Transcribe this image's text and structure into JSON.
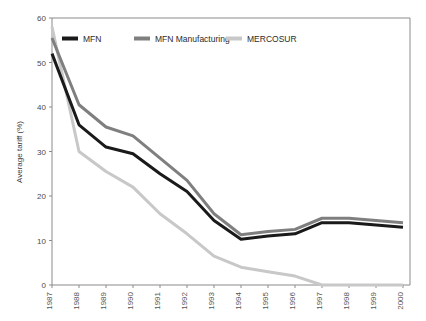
{
  "chart_data": {
    "type": "line",
    "title": "",
    "xlabel": "",
    "ylabel": "Average tariff (%)",
    "xlim": [
      1987,
      2000
    ],
    "ylim": [
      0,
      60
    ],
    "yticks": [
      0,
      10,
      20,
      30,
      40,
      50,
      60
    ],
    "grid": false,
    "legend_position": "top-left-inside",
    "x": [
      1987,
      1988,
      1989,
      1990,
      1991,
      1992,
      1993,
      1994,
      1995,
      1996,
      1997,
      1998,
      1999,
      2000
    ],
    "categories": [
      "1987",
      "1988",
      "1989",
      "1990",
      "1991",
      "1992",
      "1993",
      "1994",
      "1995",
      "1996",
      "1997",
      "1998",
      "1999",
      "2000"
    ],
    "series": [
      {
        "name": "MFN",
        "color": "#1a1a1a",
        "values": [
          52,
          36,
          31,
          29.5,
          25,
          21,
          14.5,
          10.3,
          11,
          11.5,
          14,
          14,
          13.5,
          13
        ]
      },
      {
        "name": "MFN Manufacturing",
        "color": "#7f7f7f",
        "values": [
          55.5,
          40.5,
          35.5,
          33.5,
          28.5,
          23.5,
          16,
          11.3,
          12,
          12.5,
          15,
          15,
          14.5,
          14
        ]
      },
      {
        "name": "MERCOSUR",
        "color": "#c8c8c8",
        "values": [
          58,
          30,
          25.5,
          22,
          16,
          11.5,
          6.5,
          4,
          3,
          2,
          0,
          0,
          0,
          0
        ]
      }
    ]
  },
  "axis": {
    "y_tick_labels": [
      "60",
      "50",
      "40",
      "30",
      "20",
      "10",
      "0"
    ],
    "y_axis_title": "Average tariff (%)",
    "x_tick_labels": [
      "1987",
      "1988",
      "1989",
      "1990",
      "1991",
      "1992",
      "1993",
      "1994",
      "1995",
      "1996",
      "1997",
      "1998",
      "1999",
      "2000"
    ]
  },
  "legend": {
    "items": [
      {
        "label": "MFN",
        "color": "#1a1a1a"
      },
      {
        "label": "MFN Manufacturing",
        "color": "#7f7f7f"
      },
      {
        "label": "MERCOSUR",
        "color": "#c8c8c8"
      }
    ]
  },
  "colors": {
    "background": "#ffffff",
    "axis": "#8a8a8a",
    "mfn": "#1a1a1a",
    "mfn_manufacturing": "#7f7f7f",
    "mercosur": "#c8c8c8"
  }
}
